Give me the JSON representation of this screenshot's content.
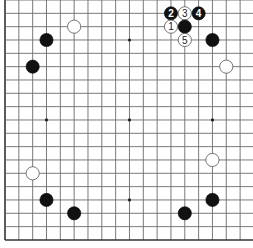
{
  "diagram": {
    "type": "go-board",
    "board_size": 19,
    "colors": {
      "background": "#ffffff",
      "grid": "#6b6b6b",
      "border": "#333333",
      "black_stone": "#111111",
      "white_stone": "#ffffff"
    },
    "star_points": [
      [
        3,
        3
      ],
      [
        9,
        3
      ],
      [
        15,
        3
      ],
      [
        3,
        9
      ],
      [
        9,
        9
      ],
      [
        15,
        9
      ],
      [
        3,
        15
      ],
      [
        9,
        15
      ],
      [
        15,
        15
      ]
    ],
    "stones": [
      {
        "color": "white",
        "col": 5,
        "row": 2,
        "label": ""
      },
      {
        "color": "black",
        "col": 3,
        "row": 3,
        "label": ""
      },
      {
        "color": "black",
        "col": 2,
        "row": 5,
        "label": ""
      },
      {
        "color": "black",
        "col": 12,
        "row": 1,
        "label": "2"
      },
      {
        "color": "white",
        "col": 13,
        "row": 1,
        "label": "3"
      },
      {
        "color": "black",
        "col": 14,
        "row": 1,
        "label": "4"
      },
      {
        "color": "white",
        "col": 12,
        "row": 2,
        "label": "1"
      },
      {
        "color": "black",
        "col": 13,
        "row": 2,
        "label": ""
      },
      {
        "color": "white",
        "col": 13,
        "row": 3,
        "label": "5"
      },
      {
        "color": "black",
        "col": 15,
        "row": 3,
        "label": ""
      },
      {
        "color": "white",
        "col": 16,
        "row": 5,
        "label": ""
      },
      {
        "color": "white",
        "col": 15,
        "row": 12,
        "label": ""
      },
      {
        "color": "white",
        "col": 2,
        "row": 13,
        "label": ""
      },
      {
        "color": "black",
        "col": 3,
        "row": 15,
        "label": ""
      },
      {
        "color": "black",
        "col": 5,
        "row": 16,
        "label": ""
      },
      {
        "color": "black",
        "col": 13,
        "row": 16,
        "label": ""
      },
      {
        "color": "black",
        "col": 15,
        "row": 15,
        "label": ""
      }
    ]
  }
}
